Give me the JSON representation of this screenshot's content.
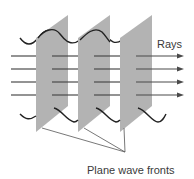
{
  "labels": {
    "rays": "Rays",
    "wave_fronts": "Plane wave fronts"
  },
  "colors": {
    "plane_fill": "#b3b3b3",
    "ray_line": "#4a4a4a",
    "wave_line": "#222222",
    "leader_line": "#555555",
    "text": "#3a3a3a"
  },
  "diagram": {
    "plane_count": 3,
    "ray_count": 4,
    "ray_y_positions": [
      56,
      69,
      82,
      95
    ],
    "plane_x_positions": [
      36,
      78,
      120
    ]
  }
}
